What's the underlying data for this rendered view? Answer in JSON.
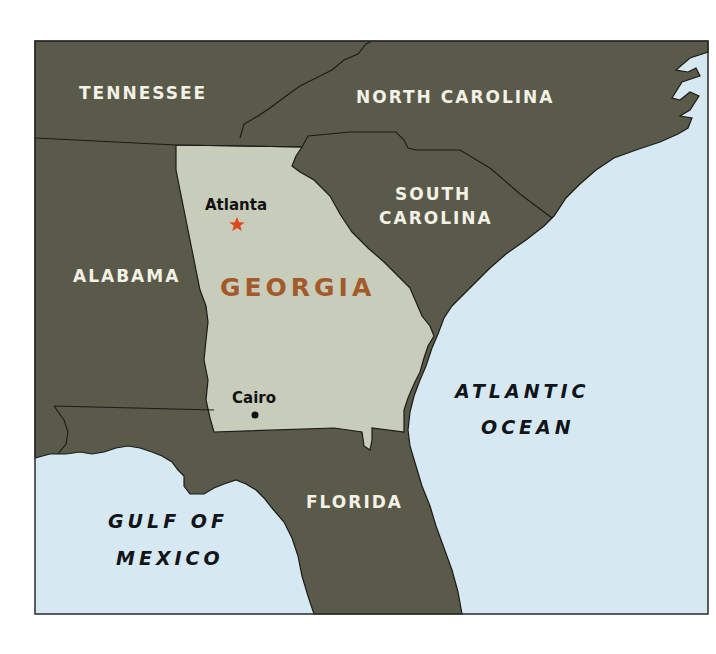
{
  "map": {
    "title": "Georgia and surrounding region",
    "colors": {
      "land_other": "#5a5a4a",
      "georgia": "#c8cdbb",
      "water": "#d6e8f2",
      "border": "#1b1b16",
      "state_label": "#f4f1e6",
      "georgia_label": "#a35a2a",
      "capital_star": "#e0461e",
      "water_label": "#111418"
    },
    "states": [
      {
        "name": "TENNESSEE"
      },
      {
        "name": "NORTH CAROLINA"
      },
      {
        "name": "SOUTH"
      },
      {
        "name": "CAROLINA"
      },
      {
        "name": "ALABAMA"
      },
      {
        "name": "FLORIDA"
      }
    ],
    "featured_state": {
      "name": "GEORGIA"
    },
    "cities": [
      {
        "name": "Atlanta",
        "type": "capital",
        "marker": "star-icon"
      },
      {
        "name": "Cairo",
        "type": "city",
        "marker": "dot-icon"
      }
    ],
    "water_bodies": [
      {
        "line1": "ATLANTIC",
        "line2": "OCEAN"
      },
      {
        "line1": "GULF OF",
        "line2": "MEXICO"
      }
    ]
  }
}
